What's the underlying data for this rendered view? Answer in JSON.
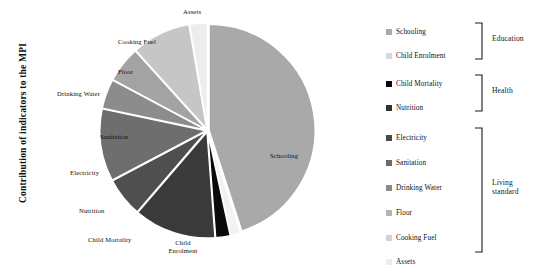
{
  "axis": {
    "y_title": "Contribution of indicators to the MPI"
  },
  "chart_data": {
    "type": "pie",
    "title": "",
    "ylabel": "Contribution of indicators to the MPI",
    "xlabel": "",
    "legend_position": "right",
    "grid": false,
    "categories": [
      "Schooling",
      "Child Enrolment",
      "Child Mortality",
      "Nutrition",
      "Electricity",
      "Sanitation",
      "Drinking Water",
      "Floor",
      "Cooking Fuel",
      "Assets"
    ],
    "values": [
      45.0,
      1.6,
      2.2,
      12.5,
      6.0,
      11.0,
      4.5,
      5.5,
      9.0,
      2.7
    ],
    "colors": [
      "#a9a9a9",
      "#f2f2f2",
      "#0a0a0a",
      "#3a3a3a",
      "#4f4f4f",
      "#6e6e6e",
      "#8c8c8c",
      "#a3a3a3",
      "#c6c6c6",
      "#ededed"
    ],
    "groups": [
      {
        "name": "Education",
        "members": [
          "Schooling",
          "Child Enrolment"
        ]
      },
      {
        "name": "Health",
        "members": [
          "Child Mortality",
          "Nutrition"
        ]
      },
      {
        "name": "Living standard",
        "members": [
          "Electricity",
          "Sanitation",
          "Drinking Water",
          "Floor",
          "Cooking Fuel",
          "Assets"
        ]
      }
    ]
  },
  "pie_labels": [
    {
      "text": "Assets"
    },
    {
      "text": "Cooking Fuel"
    },
    {
      "text": "Floor"
    },
    {
      "text": "Drinking Water"
    },
    {
      "text": "Sanitation"
    },
    {
      "text": "Electricity"
    },
    {
      "text": "Nutrition"
    },
    {
      "text": "Child Mortality"
    },
    {
      "text": "Child Enrolment"
    },
    {
      "text": "Schooling"
    }
  ],
  "legend": {
    "items": [
      {
        "label": "Schooling",
        "color": "#a9a9a9"
      },
      {
        "label": "Child Enrolment",
        "color": "#d8d8d8"
      },
      {
        "label": "Child Mortality",
        "color": "#0a0a0a"
      },
      {
        "label": "Nutrition",
        "color": "#303030"
      },
      {
        "label": "Electricity",
        "color": "#4a4a4a"
      },
      {
        "label": "Sanitation",
        "color": "#6b6b6b"
      },
      {
        "label": "Drinking Water",
        "color": "#8a8a8a"
      },
      {
        "label": "Floor",
        "color": "#b4b4b4"
      },
      {
        "label": "Cooking Fuel",
        "color": "#d2d2d2"
      },
      {
        "label": "Assets",
        "color": "#ececec"
      }
    ],
    "groups": [
      {
        "name": "Education"
      },
      {
        "name": "Health"
      },
      {
        "name": "Living standard",
        "line1": "Living",
        "line2": "standard"
      }
    ]
  }
}
